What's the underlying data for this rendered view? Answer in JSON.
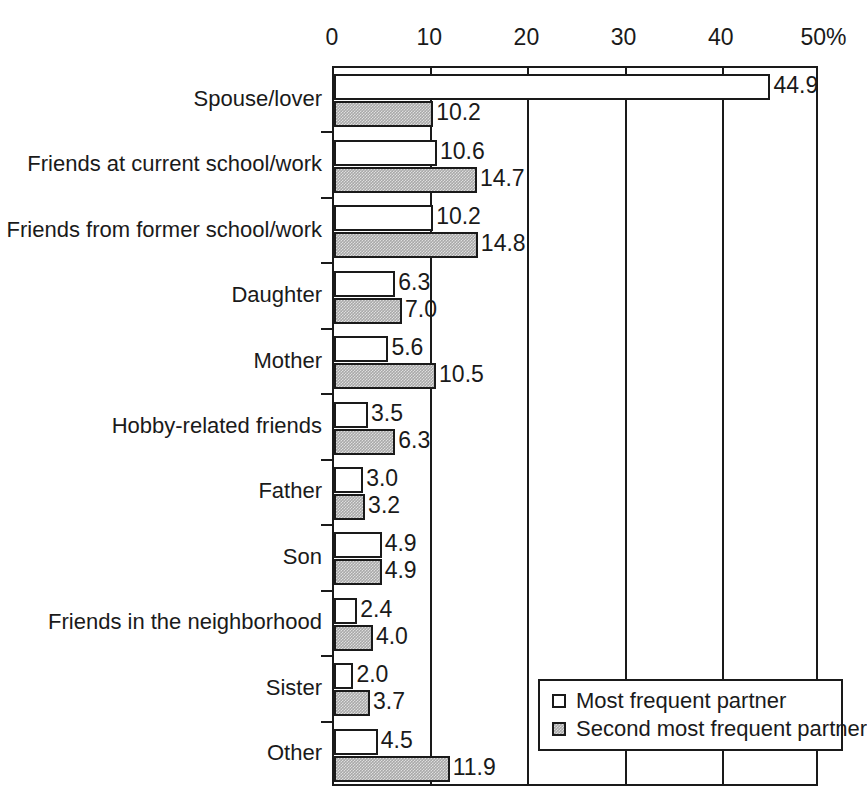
{
  "chart_data": {
    "type": "bar",
    "orientation": "horizontal",
    "title": "",
    "subtitle": "",
    "xlabel": "",
    "ylabel": "",
    "xlim": [
      0,
      50
    ],
    "xticks": [
      0,
      10,
      20,
      30,
      40,
      50
    ],
    "xtick_labels": [
      "0",
      "10",
      "20",
      "30",
      "40",
      "50%"
    ],
    "unit": "%",
    "grid": "vertical",
    "legend_position": "bottom-right",
    "categories": [
      "Spouse/lover",
      "Friends at current school/work",
      "Friends from former school/work",
      "Daughter",
      "Mother",
      "Hobby-related friends",
      "Father",
      "Son",
      "Friends in the neighborhood",
      "Sister",
      "Other"
    ],
    "series": [
      {
        "name": "Most frequent partner",
        "fill": "#ffffff",
        "values": [
          44.9,
          10.6,
          10.2,
          6.3,
          5.6,
          3.5,
          3.0,
          4.9,
          2.4,
          2.0,
          4.5
        ],
        "labels": [
          "44.9",
          "10.6",
          "10.2",
          "6.3",
          "5.6",
          "3.5",
          "3.0",
          "4.9",
          "2.4",
          "2.0",
          "4.5"
        ]
      },
      {
        "name": "Second most frequent partner",
        "fill": "#a9a9a9",
        "values": [
          10.2,
          14.7,
          14.8,
          7.0,
          10.5,
          6.3,
          3.2,
          4.9,
          4.0,
          3.7,
          11.9
        ],
        "labels": [
          "10.2",
          "14.7",
          "14.8",
          "7.0",
          "10.5",
          "6.3",
          "3.2",
          "4.9",
          "4.0",
          "3.7",
          "11.9"
        ]
      }
    ]
  },
  "legend": {
    "items": [
      {
        "label": "Most frequent partner",
        "swatch": "white-square-icon"
      },
      {
        "label": "Second most frequent partner",
        "swatch": "gray-square-icon"
      }
    ]
  },
  "colors": {
    "axis": "#1a1a1a",
    "series_1_fill": "#ffffff",
    "series_2_fill": "#a9a9a9",
    "background": "#ffffff"
  }
}
